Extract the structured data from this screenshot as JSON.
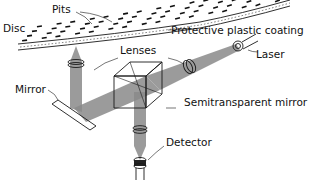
{
  "diagram": {
    "labels": {
      "disc": "Disc",
      "pits": "Pits",
      "coating": "Protective plastic coating",
      "lenses": "Lenses",
      "laser": "Laser",
      "mirror": "Mirror",
      "semitransparent_mirror": "Semitransparent mirror",
      "detector": "Detector"
    },
    "colors": {
      "ink": "#111111",
      "beam": "#8a8a8a",
      "background": "#ffffff"
    }
  }
}
